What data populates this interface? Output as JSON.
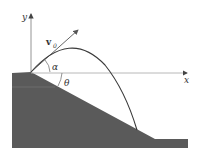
{
  "diagram": {
    "labels": {
      "y_axis": "y",
      "x_axis": "x",
      "velocity": "v",
      "velocity_subscript": "0",
      "launch_angle": "α",
      "slope_angle": "θ"
    },
    "colors": {
      "ground": "#5a5a5a",
      "axis": "#9a9a9a",
      "trajectory": "#3a3a3a",
      "vector": "#555555",
      "text": "#333333"
    }
  }
}
